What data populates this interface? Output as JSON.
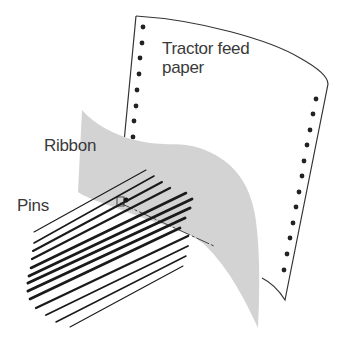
{
  "diagram": {
    "labels": {
      "paper_line1": "Tractor feed",
      "paper_line2": "paper",
      "ribbon": "Ribbon",
      "pins": "Pins"
    },
    "colors": {
      "ribbon": "#d3d3d3",
      "outline": "#333333",
      "pins": "#1a1a1a",
      "holes": "#222222",
      "text": "#3a3a3a"
    },
    "components": [
      {
        "name": "Tractor feed paper",
        "sprocket_holes_left": 8,
        "sprocket_holes_right": 13
      },
      {
        "name": "Ribbon"
      },
      {
        "name": "Pins",
        "count": 13
      }
    ]
  }
}
